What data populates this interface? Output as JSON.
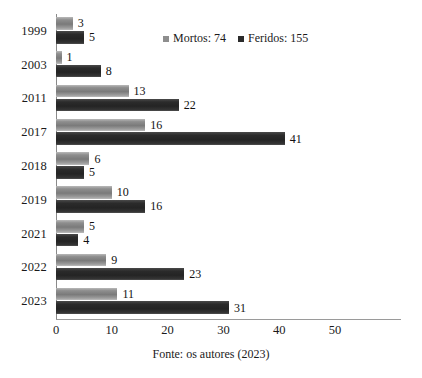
{
  "chart_data": {
    "type": "bar",
    "orientation": "horizontal",
    "title": "",
    "xlabel": "",
    "ylabel": "",
    "categories": [
      "1999",
      "2003",
      "2011",
      "2017",
      "2018",
      "2019",
      "2021",
      "2022",
      "2023"
    ],
    "series": [
      {
        "name": "Mortos",
        "total": 74,
        "color": "#8e8e8e",
        "values": [
          3,
          1,
          13,
          16,
          6,
          10,
          5,
          9,
          11
        ]
      },
      {
        "name": "Feridos",
        "total": 155,
        "color": "#2b2b2b",
        "values": [
          5,
          8,
          22,
          41,
          5,
          16,
          4,
          23,
          31
        ]
      }
    ],
    "xlim": [
      0,
      50
    ],
    "xticks": [
      0,
      10,
      20,
      30,
      40,
      50
    ],
    "xtick_labels": [
      "0",
      "10",
      "20",
      "30",
      "40",
      "50"
    ],
    "grid": false,
    "legend_position": "top-center",
    "data_labels": true
  },
  "legend": {
    "entries": [
      {
        "label": "Mortos: 74",
        "marker": "square-marker-light"
      },
      {
        "label": "Feridos: 155",
        "marker": "square-marker-dark"
      }
    ]
  },
  "caption": {
    "text": "Fonte: os autores (2023)"
  }
}
